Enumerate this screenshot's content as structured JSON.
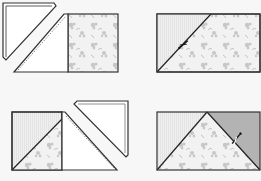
{
  "diagram": {
    "type": "quilting-steps",
    "panels": [
      {
        "id": "step-1",
        "description": "Folded triangle placed on floral square and stitched along diagonal"
      },
      {
        "id": "step-2",
        "description": "Rectangle with diagonal seam, trim indicated by scissors"
      },
      {
        "id": "step-3",
        "description": "Second triangle added to opposite side and stitched"
      },
      {
        "id": "step-4",
        "description": "Flying geese unit with gray corner, trim indicated by scissors"
      }
    ],
    "colors": {
      "background": "#f7f7f7",
      "outline": "#333333",
      "white_fabric": "#ffffff",
      "light_fabric": "#ececec",
      "floral_base": "#f2f2f2",
      "floral_motif": "#b9b9b9",
      "gray_fabric": "#b3b3b3"
    },
    "icons": [
      "scissors-icon",
      "scissors-icon"
    ]
  }
}
